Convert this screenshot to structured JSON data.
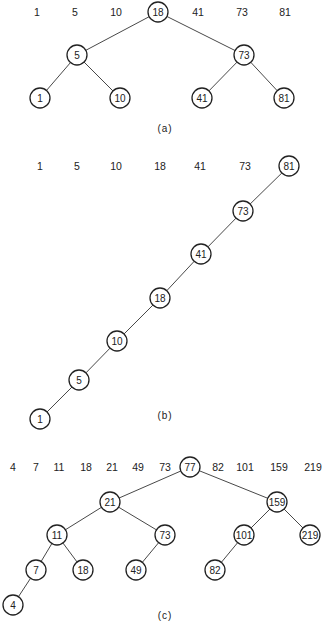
{
  "figures": [
    {
      "id": "a",
      "caption": "(a)",
      "caption_pos": [
        165,
        128
      ],
      "radius": 10,
      "keys_row_y": 12,
      "keys": [
        {
          "text": "1",
          "x": 37
        },
        {
          "text": "5",
          "x": 75
        },
        {
          "text": "10",
          "x": 116
        },
        {
          "text": "18",
          "x": 158,
          "circled": true
        },
        {
          "text": "41",
          "x": 198
        },
        {
          "text": "73",
          "x": 242
        },
        {
          "text": "81",
          "x": 285
        }
      ],
      "nodes": [
        {
          "id": "a18",
          "text": "18",
          "x": 158,
          "y": 12
        },
        {
          "id": "a5",
          "text": "5",
          "x": 77,
          "y": 55
        },
        {
          "id": "a73",
          "text": "73",
          "x": 244,
          "y": 55
        },
        {
          "id": "a1",
          "text": "1",
          "x": 40,
          "y": 98
        },
        {
          "id": "a10",
          "text": "10",
          "x": 120,
          "y": 98
        },
        {
          "id": "a41",
          "text": "41",
          "x": 202,
          "y": 98
        },
        {
          "id": "a81",
          "text": "81",
          "x": 284,
          "y": 98
        }
      ],
      "edges": [
        [
          "a18",
          "a5"
        ],
        [
          "a18",
          "a73"
        ],
        [
          "a5",
          "a1"
        ],
        [
          "a5",
          "a10"
        ],
        [
          "a73",
          "a41"
        ],
        [
          "a73",
          "a81"
        ]
      ]
    },
    {
      "id": "b",
      "caption": "(b)",
      "caption_pos": [
        165,
        415
      ],
      "radius": 10,
      "keys_row_y": 166,
      "keys": [
        {
          "text": "1",
          "x": 40
        },
        {
          "text": "5",
          "x": 77
        },
        {
          "text": "10",
          "x": 116
        },
        {
          "text": "18",
          "x": 160
        },
        {
          "text": "41",
          "x": 200
        },
        {
          "text": "73",
          "x": 245
        },
        {
          "text": "81",
          "x": 289,
          "circled": true
        }
      ],
      "nodes": [
        {
          "id": "b81",
          "text": "81",
          "x": 289,
          "y": 166
        },
        {
          "id": "b73",
          "text": "73",
          "x": 243,
          "y": 211
        },
        {
          "id": "b41",
          "text": "41",
          "x": 201,
          "y": 254
        },
        {
          "id": "b18",
          "text": "18",
          "x": 160,
          "y": 298
        },
        {
          "id": "b10",
          "text": "10",
          "x": 117,
          "y": 341
        },
        {
          "id": "b5",
          "text": "5",
          "x": 79,
          "y": 380
        },
        {
          "id": "b1",
          "text": "1",
          "x": 40,
          "y": 419
        }
      ],
      "edges": [
        [
          "b81",
          "b73"
        ],
        [
          "b73",
          "b41"
        ],
        [
          "b41",
          "b18"
        ],
        [
          "b18",
          "b10"
        ],
        [
          "b10",
          "b5"
        ],
        [
          "b5",
          "b1"
        ]
      ]
    },
    {
      "id": "c",
      "caption": "(c)",
      "caption_pos": [
        165,
        615
      ],
      "radius": 10,
      "keys_row_y": 467,
      "keys": [
        {
          "text": "4",
          "x": 13
        },
        {
          "text": "7",
          "x": 36
        },
        {
          "text": "11",
          "x": 59
        },
        {
          "text": "18",
          "x": 86
        },
        {
          "text": "21",
          "x": 112
        },
        {
          "text": "49",
          "x": 138
        },
        {
          "text": "73",
          "x": 165
        },
        {
          "text": "77",
          "x": 190,
          "circled": true
        },
        {
          "text": "82",
          "x": 218
        },
        {
          "text": "101",
          "x": 245
        },
        {
          "text": "159",
          "x": 279
        },
        {
          "text": "219",
          "x": 313
        }
      ],
      "nodes": [
        {
          "id": "c77",
          "text": "77",
          "x": 190,
          "y": 467
        },
        {
          "id": "c21",
          "text": "21",
          "x": 110,
          "y": 502
        },
        {
          "id": "c159",
          "text": "159",
          "x": 277,
          "y": 502
        },
        {
          "id": "c11",
          "text": "11",
          "x": 57,
          "y": 535
        },
        {
          "id": "c73",
          "text": "73",
          "x": 165,
          "y": 535
        },
        {
          "id": "c101",
          "text": "101",
          "x": 244,
          "y": 535
        },
        {
          "id": "c219",
          "text": "219",
          "x": 310,
          "y": 535
        },
        {
          "id": "c7",
          "text": "7",
          "x": 36,
          "y": 570
        },
        {
          "id": "c18",
          "text": "18",
          "x": 83,
          "y": 570
        },
        {
          "id": "c49",
          "text": "49",
          "x": 136,
          "y": 570
        },
        {
          "id": "c82",
          "text": "82",
          "x": 215,
          "y": 570
        },
        {
          "id": "c4",
          "text": "4",
          "x": 13,
          "y": 605
        }
      ],
      "edges": [
        [
          "c77",
          "c21"
        ],
        [
          "c77",
          "c159"
        ],
        [
          "c21",
          "c11"
        ],
        [
          "c21",
          "c73"
        ],
        [
          "c159",
          "c101"
        ],
        [
          "c159",
          "c219"
        ],
        [
          "c11",
          "c7"
        ],
        [
          "c11",
          "c18"
        ],
        [
          "c73",
          "c49"
        ],
        [
          "c101",
          "c82"
        ],
        [
          "c7",
          "c4"
        ]
      ]
    }
  ]
}
